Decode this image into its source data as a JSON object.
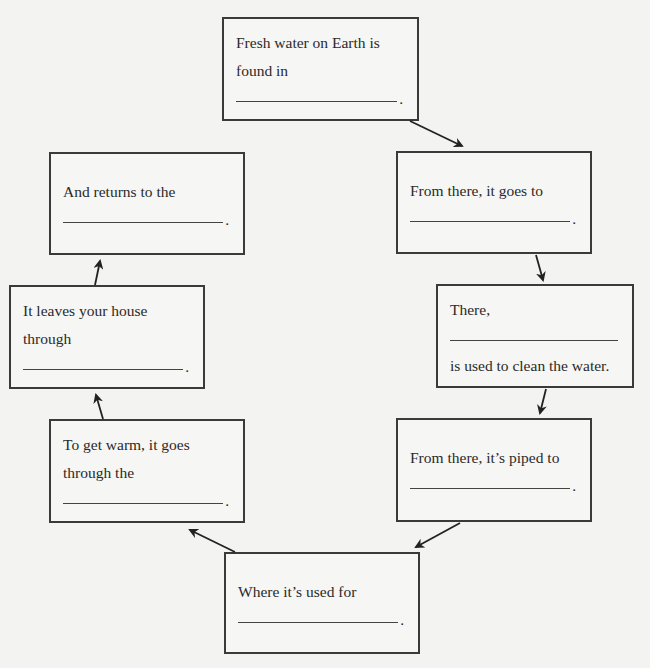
{
  "diagram": {
    "type": "cycle",
    "title": "",
    "boxes": [
      {
        "id": "b1",
        "lines_before": [
          "Fresh water on Earth is",
          "found in"
        ],
        "lines_after": [],
        "end": "."
      },
      {
        "id": "b2",
        "lines_before": [
          "From there, it goes to"
        ],
        "lines_after": [],
        "end": "."
      },
      {
        "id": "b3",
        "lines_before": [
          "There,"
        ],
        "lines_after": [
          "is used to clean the water."
        ],
        "end": ""
      },
      {
        "id": "b4",
        "lines_before": [
          "From there, it’s piped to"
        ],
        "lines_after": [],
        "end": "."
      },
      {
        "id": "b5",
        "lines_before": [
          "Where it’s used for"
        ],
        "lines_after": [],
        "end": "."
      },
      {
        "id": "b6",
        "lines_before": [
          "To get warm, it goes",
          "through the"
        ],
        "lines_after": [],
        "end": "."
      },
      {
        "id": "b7",
        "lines_before": [
          "It leaves your house",
          "through"
        ],
        "lines_after": [],
        "end": "."
      },
      {
        "id": "b8",
        "lines_before": [
          "And returns to the"
        ],
        "lines_after": [],
        "end": "."
      }
    ],
    "edges": [
      [
        "b1",
        "b2"
      ],
      [
        "b2",
        "b3"
      ],
      [
        "b3",
        "b4"
      ],
      [
        "b4",
        "b5"
      ],
      [
        "b5",
        "b6"
      ],
      [
        "b6",
        "b7"
      ],
      [
        "b7",
        "b8"
      ]
    ],
    "colors": {
      "line": "#3a3a3a",
      "background": "#f3f3f1"
    }
  }
}
